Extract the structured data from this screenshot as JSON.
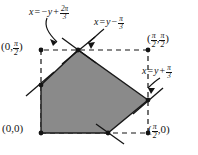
{
  "figure": {
    "kind": "geometry-diagram",
    "colors": {
      "fill": "#8a8a8a",
      "stroke": "#141414",
      "dashed": "#141414",
      "background": "#ffffff"
    },
    "axes": {
      "x_range": [
        0,
        1.5708
      ],
      "y_range": [
        0,
        1.5708
      ]
    },
    "dashed_rectangle": {
      "corners": [
        "(0,0)",
        "(pi/2,0)",
        "(pi/2,pi/2)",
        "(0,pi/2)"
      ]
    },
    "region_vertices": [
      {
        "name": "origin-corner",
        "label": "(0,0)",
        "x": 41,
        "y": 133
      },
      {
        "name": "bottom-edge-vertex",
        "label": "",
        "x": 108,
        "y": 133
      },
      {
        "name": "right-vertex",
        "label": "",
        "x": 148,
        "y": 100
      },
      {
        "name": "top-vertex",
        "label": "",
        "x": 78,
        "y": 50
      },
      {
        "name": "left-vertex",
        "label": "",
        "x": 41,
        "y": 85
      }
    ],
    "point_labels": [
      {
        "name": "label-origin",
        "text": "(0,0)",
        "x": 2,
        "y": 124
      },
      {
        "name": "label-left-top",
        "text": "(0, pi/2)",
        "x": 1,
        "y": 41
      },
      {
        "name": "label-top-right",
        "text": "(pi/2, pi/2)",
        "x": 147,
        "y": 33
      },
      {
        "name": "label-bottom-right",
        "text": "(pi/2, 0)",
        "x": 148,
        "y": 124
      }
    ],
    "line_labels": [
      {
        "name": "line-label-upper-left",
        "text": "x = -y + 2pi/3",
        "x": 30,
        "y": 7
      },
      {
        "name": "line-label-upper-right",
        "text": "x = y - pi/3",
        "x": 95,
        "y": 17
      },
      {
        "name": "line-label-right",
        "text": "x = y + pi/3",
        "x": 143,
        "y": 66
      }
    ],
    "parts": {
      "lhs_x": "x",
      "equals": "=",
      "neg_y": "−y",
      "plus": "+",
      "minus": "−",
      "y": "y",
      "pi": "π",
      "two_pi": "2π",
      "three": "3",
      "two": "2",
      "zero": "0",
      "comma": ",",
      "open_paren": "(",
      "close_paren": ")"
    }
  }
}
